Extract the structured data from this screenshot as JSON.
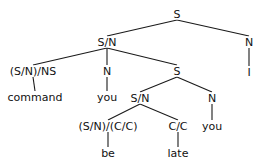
{
  "diagram": {
    "type": "categorial-grammar-parse-tree",
    "nodes": [
      {
        "id": "n0",
        "label": "S",
        "x": 177,
        "y": 14
      },
      {
        "id": "n1",
        "label": "S/N",
        "x": 107,
        "y": 42
      },
      {
        "id": "n2",
        "label": "N",
        "x": 249,
        "y": 42
      },
      {
        "id": "n3",
        "label": "I",
        "x": 249,
        "y": 72
      },
      {
        "id": "n4",
        "label": "(S/N)/NS",
        "x": 33,
        "y": 71
      },
      {
        "id": "n5",
        "label": "N",
        "x": 107,
        "y": 71
      },
      {
        "id": "n6",
        "label": "S",
        "x": 177,
        "y": 71
      },
      {
        "id": "n7",
        "label": "command",
        "x": 35,
        "y": 97
      },
      {
        "id": "n8",
        "label": "you",
        "x": 107,
        "y": 97
      },
      {
        "id": "n9",
        "label": "S/N",
        "x": 140,
        "y": 98
      },
      {
        "id": "n10",
        "label": "N",
        "x": 212,
        "y": 98
      },
      {
        "id": "n11",
        "label": "(S/N)/(C/C)",
        "x": 108,
        "y": 126
      },
      {
        "id": "n12",
        "label": "C/C",
        "x": 178,
        "y": 126
      },
      {
        "id": "n13",
        "label": "you",
        "x": 212,
        "y": 126
      },
      {
        "id": "n14",
        "label": "be",
        "x": 108,
        "y": 153
      },
      {
        "id": "n15",
        "label": "late",
        "x": 178,
        "y": 153
      }
    ],
    "edges": [
      [
        "n0",
        "n1"
      ],
      [
        "n0",
        "n2"
      ],
      [
        "n2",
        "n3"
      ],
      [
        "n1",
        "n4"
      ],
      [
        "n1",
        "n5"
      ],
      [
        "n1",
        "n6"
      ],
      [
        "n4",
        "n7"
      ],
      [
        "n5",
        "n8"
      ],
      [
        "n6",
        "n9"
      ],
      [
        "n6",
        "n10"
      ],
      [
        "n9",
        "n11"
      ],
      [
        "n9",
        "n12"
      ],
      [
        "n10",
        "n13"
      ],
      [
        "n11",
        "n14"
      ],
      [
        "n12",
        "n15"
      ]
    ]
  }
}
